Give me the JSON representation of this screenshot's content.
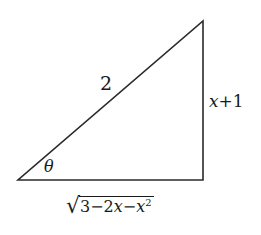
{
  "diagram": {
    "type": "right-triangle",
    "stroke_color": "#2a2a2a",
    "vertices": {
      "bottom_left": [
        18,
        180
      ],
      "bottom_right": [
        203,
        180
      ],
      "top_right": [
        203,
        21
      ]
    },
    "labels": {
      "hypotenuse": "2",
      "opposite_var": "x",
      "opposite_rest": "+1",
      "angle": "θ",
      "adjacent_radical": "√",
      "adjacent_radicand_pre": "3−2",
      "adjacent_radicand_x1": "x",
      "adjacent_radicand_mid": "−",
      "adjacent_radicand_x2": "x",
      "adjacent_radicand_exp": "2"
    }
  }
}
